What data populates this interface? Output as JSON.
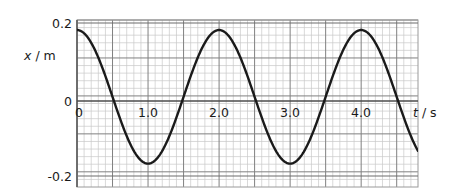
{
  "figure": {
    "type": "line-graph"
  },
  "axes": {
    "y_axis_label": "x / m",
    "y_axis_label_var": "x",
    "y_axis_label_unit": "/ m",
    "x_axis_label": "t / s",
    "x_axis_label_var": "t",
    "x_axis_label_unit": "/ s",
    "y_ticks": [
      {
        "value": 0.2,
        "label": "0.2"
      },
      {
        "value": 0,
        "label": "0"
      },
      {
        "value": -0.2,
        "label": "-0.2"
      }
    ],
    "x_ticks": [
      {
        "value": 0,
        "label": "0"
      },
      {
        "value": 1.0,
        "label": "1.0"
      },
      {
        "value": 2.0,
        "label": "2.0"
      },
      {
        "value": 3.0,
        "label": "3.0"
      },
      {
        "value": 4.0,
        "label": "4.0"
      }
    ]
  },
  "colors": {
    "curve": "#1a1a1a",
    "major_grid": "#808080",
    "minor_grid": "#c8c8c8",
    "axis": "#4d4d4d",
    "text": "#1a1a1a",
    "background": "#ffffff"
  },
  "chart_data": {
    "type": "line",
    "title": "",
    "xlabel": "t / s",
    "ylabel": "x / m",
    "xlim": [
      0,
      4.8
    ],
    "ylim": [
      -0.27,
      0.23
    ],
    "grid": true,
    "legend": "none",
    "equation": "x = 0.2 cos(pi t)",
    "amplitude": 0.2,
    "period": 2.0,
    "frequency": 0.5,
    "series": [
      {
        "name": "displacement",
        "x": [
          0,
          0.1,
          0.2,
          0.3,
          0.4,
          0.5,
          0.6,
          0.7,
          0.8,
          0.9,
          1.0,
          1.1,
          1.2,
          1.3,
          1.4,
          1.5,
          1.6,
          1.7,
          1.8,
          1.9,
          2.0,
          2.1,
          2.2,
          2.3,
          2.4,
          2.5,
          2.6,
          2.7,
          2.8,
          2.9,
          3.0,
          3.1,
          3.2,
          3.3,
          3.4,
          3.5,
          3.6,
          3.7,
          3.8,
          3.9,
          4.0,
          4.1,
          4.2,
          4.3,
          4.4,
          4.5
        ],
        "y": [
          0.2,
          0.19,
          0.162,
          0.118,
          0.062,
          0.0,
          -0.062,
          -0.118,
          -0.162,
          -0.19,
          -0.2,
          -0.19,
          -0.162,
          -0.118,
          -0.062,
          0.0,
          0.062,
          0.118,
          0.162,
          0.19,
          0.2,
          0.19,
          0.162,
          0.118,
          0.062,
          0.0,
          -0.062,
          -0.118,
          -0.162,
          -0.19,
          -0.2,
          -0.19,
          -0.162,
          -0.118,
          -0.062,
          0.0,
          0.062,
          0.118,
          0.162,
          0.19,
          0.2,
          0.19,
          0.162,
          0.118,
          0.062,
          0.0
        ]
      }
    ],
    "key_points": [
      {
        "t": 0.0,
        "x": 0.2,
        "kind": "maximum"
      },
      {
        "t": 0.5,
        "x": 0.0,
        "kind": "zero-crossing"
      },
      {
        "t": 1.0,
        "x": -0.2,
        "kind": "minimum"
      },
      {
        "t": 1.5,
        "x": 0.0,
        "kind": "zero-crossing"
      },
      {
        "t": 2.0,
        "x": 0.2,
        "kind": "maximum"
      },
      {
        "t": 2.5,
        "x": 0.0,
        "kind": "zero-crossing"
      },
      {
        "t": 3.0,
        "x": -0.2,
        "kind": "minimum"
      },
      {
        "t": 3.5,
        "x": 0.0,
        "kind": "zero-crossing"
      },
      {
        "t": 4.0,
        "x": 0.2,
        "kind": "maximum"
      },
      {
        "t": 4.5,
        "x": 0.0,
        "kind": "zero-crossing"
      }
    ]
  }
}
